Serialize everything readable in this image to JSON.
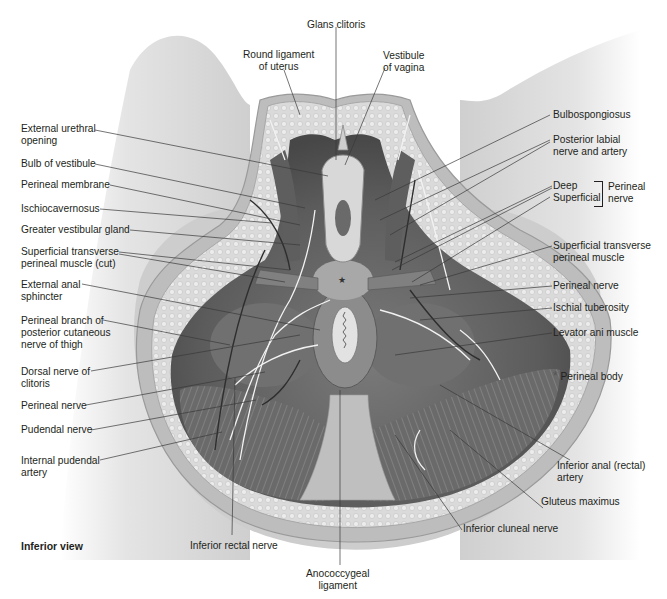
{
  "figure": {
    "view_caption": "Inferior view",
    "colors": {
      "background": "#ffffff",
      "label_text": "#231f20",
      "leader_line": "#3a3a3a",
      "skin_light": "#e6e6e6",
      "skin_mid": "#c9c9c9",
      "skin_dark": "#9e9e9e",
      "fat": "#d9d9d9",
      "muscle": "#6e6e6e",
      "muscle_dark": "#4a4a4a",
      "vessel": "#2e2e2e",
      "nerve": "#f2f2f2"
    },
    "labels_top": [
      {
        "id": "glans-clitoris",
        "text": "Glans clitoris"
      },
      {
        "id": "round-ligament",
        "lines": [
          "Round ligament",
          "of uterus"
        ]
      },
      {
        "id": "vestibule-vagina",
        "lines": [
          "Vestibule",
          "of vagina"
        ]
      }
    ],
    "labels_left": [
      {
        "id": "external-urethral-opening",
        "lines": [
          "External urethral",
          "opening"
        ]
      },
      {
        "id": "bulb-of-vestibule",
        "lines": [
          "Bulb of vestibule"
        ]
      },
      {
        "id": "perineal-membrane",
        "lines": [
          "Perineal membrane"
        ]
      },
      {
        "id": "ischiocavernosus",
        "lines": [
          "Ischiocavernosus"
        ]
      },
      {
        "id": "greater-vestibular-gland",
        "lines": [
          "Greater vestibular gland"
        ]
      },
      {
        "id": "superficial-transverse-perineal-muscle-cut",
        "lines": [
          "Superficial transverse",
          "perineal muscle (cut)"
        ]
      },
      {
        "id": "external-anal-sphincter",
        "lines": [
          "External anal",
          "sphincter"
        ]
      },
      {
        "id": "perineal-branch-posterior-cutaneous",
        "lines": [
          "Perineal branch of",
          "posterior cutaneous",
          "nerve of thigh"
        ]
      },
      {
        "id": "dorsal-nerve-clitoris",
        "lines": [
          "Dorsal nerve of",
          "clitoris"
        ]
      },
      {
        "id": "perineal-nerve-left",
        "lines": [
          "Perineal nerve"
        ]
      },
      {
        "id": "pudendal-nerve",
        "lines": [
          "Pudendal nerve"
        ]
      },
      {
        "id": "internal-pudendal-artery",
        "lines": [
          "Internal pudendal",
          "artery"
        ]
      }
    ],
    "labels_right": [
      {
        "id": "bulbospongiosus",
        "lines": [
          "Bulbospongiosus"
        ]
      },
      {
        "id": "posterior-labial-nerve-artery",
        "lines": [
          "Posterior labial",
          "nerve and artery"
        ]
      },
      {
        "id": "deep",
        "lines": [
          "Deep"
        ]
      },
      {
        "id": "superficial",
        "lines": [
          "Superficial"
        ]
      },
      {
        "id": "perineal-nerve-group",
        "lines": [
          "Perineal",
          "nerve"
        ]
      },
      {
        "id": "superficial-transverse-perineal-muscle",
        "lines": [
          "Superficial transverse",
          "perineal muscle"
        ]
      },
      {
        "id": "perineal-nerve-right",
        "lines": [
          "Perineal nerve"
        ]
      },
      {
        "id": "ischial-tuberosity",
        "lines": [
          "Ischial tuberosity"
        ]
      },
      {
        "id": "levator-ani-muscle",
        "lines": [
          "Levator ani muscle"
        ]
      },
      {
        "id": "perineal-body",
        "symbol": "*",
        "lines": [
          "Perineal body"
        ]
      },
      {
        "id": "inferior-anal-rectal-artery",
        "lines": [
          "Inferior anal (rectal)",
          "artery"
        ]
      },
      {
        "id": "gluteus-maximus",
        "lines": [
          "Gluteus maximus"
        ]
      },
      {
        "id": "inferior-cluneal-nerve",
        "lines": [
          "Inferior cluneal nerve"
        ]
      }
    ],
    "labels_bottom": [
      {
        "id": "inferior-rectal-nerve",
        "lines": [
          "Inferior rectal nerve"
        ]
      },
      {
        "id": "anococcygeal-ligament",
        "lines": [
          "Anococcygeal",
          "ligament"
        ]
      }
    ]
  }
}
